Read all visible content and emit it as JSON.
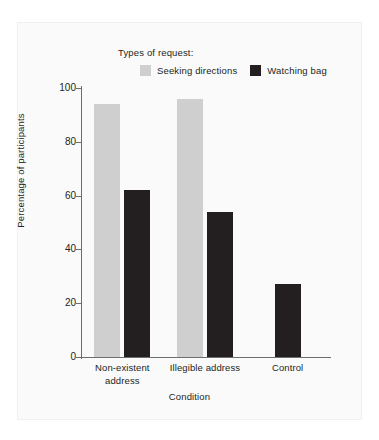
{
  "chart_data": {
    "type": "bar",
    "title": "",
    "xlabel": "Condition",
    "ylabel": "Percentage of participants",
    "categories": [
      "Non-existent address",
      "Illegible address",
      "Control"
    ],
    "category_lines": [
      [
        "Non-existent",
        "address"
      ],
      [
        "Illegible address"
      ],
      [
        "Control"
      ]
    ],
    "series": [
      {
        "name": "Seeking directions",
        "color": "#cfcfcf",
        "values": [
          94,
          96,
          null
        ]
      },
      {
        "name": "Watching bag",
        "color": "#231f20",
        "values": [
          62,
          54,
          27
        ]
      }
    ],
    "ylim": [
      0,
      100
    ],
    "yticks": [
      0,
      20,
      40,
      60,
      80,
      100
    ],
    "ytick_labels": [
      "0",
      "20",
      "40",
      "60",
      "80",
      "100"
    ],
    "grid": false,
    "legend_position": "top"
  },
  "legend": {
    "title": "Types of request:",
    "entries": [
      {
        "label": "Seeking directions",
        "swatch_color": "#cfcfcf"
      },
      {
        "label": "Watching bag",
        "swatch_color": "#231f20"
      }
    ]
  },
  "axes": {
    "x_title": "Condition",
    "y_title": "Percentage of participants"
  },
  "colors": {
    "seeking_directions": "#cfcfcf",
    "watching_bag": "#231f20",
    "axis": "#6d6e71",
    "panel_background": "#fafafa",
    "text": "#231f20"
  }
}
